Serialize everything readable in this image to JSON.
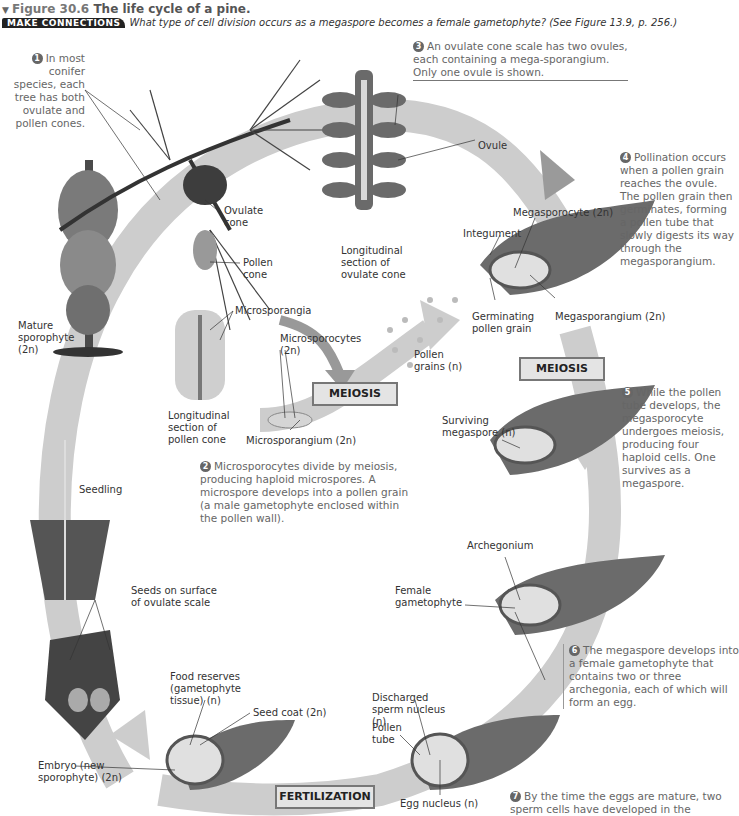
{
  "header": {
    "figure_number": "Figure 30.6",
    "title": "The life cycle of a pine.",
    "make_connections_badge": "MAKE CONNECTIONS",
    "make_connections_question": "What type of cell division occurs as a megaspore becomes a female gametophyte? (See Figure 13.9, p. 256.)"
  },
  "steps": [
    {
      "num": "1",
      "text": "In most conifer species, each tree has both ovulate and pollen cones."
    },
    {
      "num": "2",
      "text": "Microsporocytes divide by meiosis, producing haploid microspores. A microspore develops into a pollen grain (a male gametophyte enclosed within the pollen wall)."
    },
    {
      "num": "3",
      "text": "An ovulate cone scale has two ovules, each containing a mega-sporangium. Only one ovule is shown."
    },
    {
      "num": "4",
      "text": "Pollination occurs when a pollen grain reaches the ovule. The pollen grain then germinates, forming a pollen tube that slowly digests its way through the megasporangium."
    },
    {
      "num": "5",
      "text": "While the pollen tube develops, the megasporocyte undergoes meiosis, producing four haploid cells. One survives as a megaspore."
    },
    {
      "num": "6",
      "text": "The megaspore develops into a female gametophyte that contains two or three archegonia, each of which will form an egg."
    },
    {
      "num": "7",
      "text": "By the time the eggs are mature, two sperm cells have developed in the"
    }
  ],
  "labels": {
    "ovulate_cone": "Ovulate cone",
    "pollen_cone": "Pollen cone",
    "mature_sporophyte": "Mature sporophyte (2n)",
    "microsporangia": "Microsporangia",
    "microsporocytes": "Microsporocytes (2n)",
    "long_section_pollen_cone": "Longitudinal section of pollen cone",
    "microsporangium": "Microsporangium (2n)",
    "long_section_ovulate_cone": "Longitudinal section of ovulate cone",
    "ovule": "Ovule",
    "integument": "Integument",
    "megasporocyte": "Megasporocyte (2n)",
    "megasporangium": "Megasporangium (2n)",
    "germinating_pollen_grain": "Germinating pollen grain",
    "pollen_grains": "Pollen grains (n)",
    "surviving_megaspore": "Surviving megaspore (n)",
    "archegonium": "Archegonium",
    "female_gametophyte": "Female gametophyte",
    "seedling": "Seedling",
    "seeds_on_surface": "Seeds on surface of ovulate scale",
    "food_reserves": "Food reserves (gametophyte tissue) (n)",
    "seed_coat": "Seed coat (2n)",
    "embryo": "Embryo (new sporophyte) (2n)",
    "discharged_sperm": "Discharged sperm nucleus (n)",
    "pollen_tube": "Pollen tube",
    "egg_nucleus": "Egg nucleus (n)"
  },
  "process_boxes": {
    "meiosis_1": "MEIOSIS",
    "meiosis_2": "MEIOSIS",
    "fertilization": "FERTILIZATION"
  },
  "colors": {
    "cycle_arrow": "#c9c9c9",
    "tissue": "#6b6b6b",
    "step_text": "#666666",
    "box_fill": "#e4e4e4"
  }
}
